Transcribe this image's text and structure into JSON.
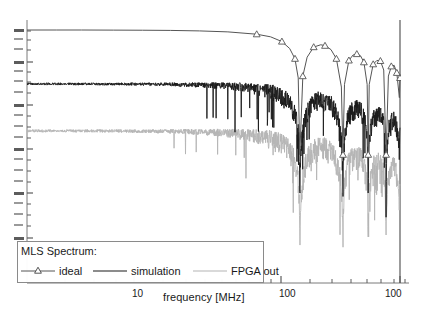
{
  "chart_data": {
    "type": "line",
    "title": "",
    "xlabel": "frequency [MHz]",
    "ylabel": "",
    "xscale": "log",
    "yscale": "log",
    "xlim": [
      2.5,
      1000
    ],
    "xticks": [
      10,
      100,
      1000
    ],
    "xtick_labels": [
      "10",
      "100",
      "100"
    ],
    "grid": false,
    "legend_position": "bottom-left",
    "legend_title": "MLS Spectrum:",
    "series": [
      {
        "name": "ideal",
        "color": "#555555",
        "marker": "triangle-up",
        "description": "sinc-shaped MLS envelope, flat to ~120 MHz then nulls at 200, 400, 600, 800, 1000 MHz",
        "x": [
          2.5,
          4,
          6,
          10,
          16,
          25,
          40,
          63,
          100,
          125,
          150,
          170,
          185,
          195,
          200,
          210,
          225,
          250,
          280,
          300,
          330,
          360,
          390,
          400,
          410,
          440,
          470,
          500,
          530,
          560,
          590,
          600,
          610,
          650,
          690,
          730,
          770,
          800,
          830,
          870,
          910,
          950,
          990,
          1000
        ],
        "y": [
          1.0,
          1.0,
          1.0,
          0.995,
          0.99,
          0.982,
          0.96,
          0.92,
          0.83,
          0.74,
          0.6,
          0.44,
          0.28,
          0.12,
          0.004,
          0.13,
          0.3,
          0.47,
          0.52,
          0.5,
          0.42,
          0.28,
          0.08,
          0.004,
          0.09,
          0.26,
          0.33,
          0.345,
          0.32,
          0.24,
          0.09,
          0.004,
          0.09,
          0.22,
          0.26,
          0.255,
          0.17,
          0.004,
          0.13,
          0.2,
          0.21,
          0.15,
          0.05,
          0.12
        ],
        "marker_x": [
          100,
          150,
          185,
          210,
          250,
          300,
          360,
          400,
          440,
          500,
          560,
          600,
          650,
          730,
          800,
          870,
          950,
          1000
        ]
      },
      {
        "name": "simulation",
        "color": "#1a1a1a",
        "marker": "none",
        "description": "noisy measured spectrum, flat band to ~120 MHz then rolling off with deep nulls",
        "noise_floor_start_db": 0.0,
        "rolloff_start_mhz": 120
      },
      {
        "name": "FPGA out",
        "color": "#b4b4b4",
        "marker": "none",
        "description": "noisy FPGA output spectrum, offset below simulation by about one decade",
        "noise_floor_start_db": -20.0,
        "rolloff_start_mhz": 120
      }
    ]
  },
  "axes": {
    "xaxis": {
      "title": "frequency [MHz]",
      "ticks": [
        {
          "label": "10",
          "value": 10
        },
        {
          "label": "100",
          "value": 100
        },
        {
          "label": "100",
          "value": 1000
        }
      ]
    },
    "yaxis": {
      "title": "",
      "ticks": []
    }
  },
  "legend": {
    "title": "MLS Spectrum:",
    "entries": [
      {
        "label": "ideal",
        "color": "#555555",
        "marker": "triangle-up"
      },
      {
        "label": "simulation",
        "color": "#1a1a1a",
        "marker": "none"
      },
      {
        "label": "FPGA out",
        "color": "#b4b4b4",
        "marker": "none"
      }
    ]
  },
  "colors": {
    "ideal": "#555555",
    "simulation": "#1a1a1a",
    "fpga": "#b4b4b4",
    "axis": "#7a7a7a",
    "text": "#1a1a1a",
    "background": "#ffffff"
  }
}
